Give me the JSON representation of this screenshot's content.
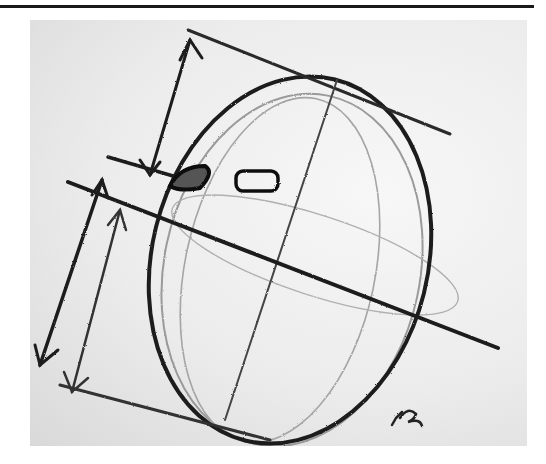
{
  "page": {
    "top_rule": true
  },
  "figure": {
    "type": "photograph of pencil sketch",
    "annotation": "✓η",
    "colors": {
      "paper": "#ececec",
      "graphite": "#1c1c1c",
      "light_graphite": "#8a8a8a"
    }
  }
}
